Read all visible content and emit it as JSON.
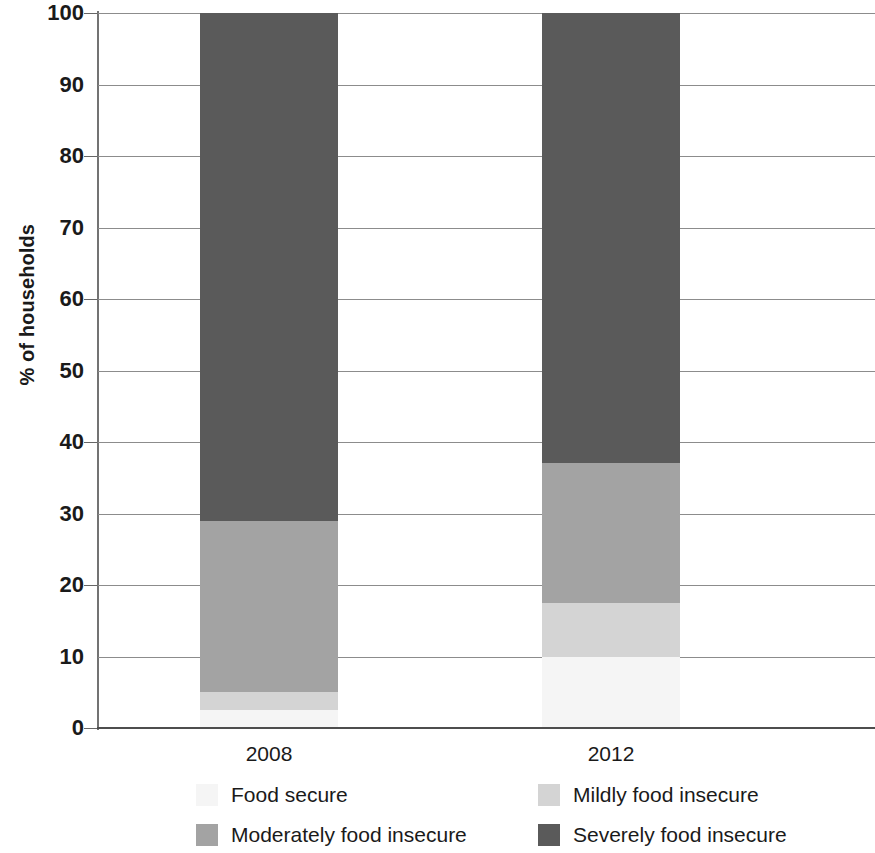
{
  "chart_data": {
    "type": "bar",
    "subtype": "stacked-bar-100",
    "title": "",
    "xlabel": "",
    "ylabel": "% of households",
    "categories": [
      "2008",
      "2012"
    ],
    "ylim": [
      0,
      100
    ],
    "yticks": [
      0,
      10,
      20,
      30,
      40,
      50,
      60,
      70,
      80,
      90,
      100
    ],
    "ytick_labels": [
      "0",
      "10",
      "20",
      "30",
      "40",
      "50",
      "60",
      "70",
      "80",
      "90",
      "100"
    ],
    "grid": true,
    "legend_position": "bottom",
    "stack_order_bottom_to_top": [
      "Food secure",
      "Mildly food insecure",
      "Moderately food insecure",
      "Severely food insecure"
    ],
    "series": [
      {
        "name": "Food secure",
        "color": "#f5f5f5",
        "values": [
          2.5,
          10.0
        ]
      },
      {
        "name": "Mildly food insecure",
        "color": "#d4d4d4",
        "values": [
          2.5,
          7.5
        ]
      },
      {
        "name": "Moderately food insecure",
        "color": "#a3a3a3",
        "values": [
          24.0,
          19.5
        ]
      },
      {
        "name": "Severely food insecure",
        "color": "#5a5a5a",
        "values": [
          71.0,
          63.0
        ]
      }
    ],
    "cumulative_tops": {
      "2008": {
        "Food secure": 2.5,
        "Mildly food insecure": 5.0,
        "Moderately food insecure": 29.0,
        "Severely food insecure": 100.0
      },
      "2012": {
        "Food secure": 10.0,
        "Mildly food insecure": 17.5,
        "Moderately food insecure": 37.0,
        "Severely food insecure": 100.0
      }
    },
    "legend": [
      {
        "label": "Food secure",
        "color": "#f5f5f5"
      },
      {
        "label": "Mildly food insecure",
        "color": "#d4d4d4"
      },
      {
        "label": "Moderately food insecure",
        "color": "#a3a3a3"
      },
      {
        "label": "Severely food insecure",
        "color": "#5a5a5a"
      }
    ]
  },
  "axis": {
    "y_title": "% of households"
  },
  "colors": {
    "food_secure": "#f5f5f5",
    "mildly_food_insecure": "#d4d4d4",
    "moderately_food_insecure": "#a3a3a3",
    "severely_food_insecure": "#5a5a5a",
    "gridline": "#8c8c8c",
    "axis": "#4d4d4d",
    "text": "#1a1a1a",
    "background": "#ffffff"
  }
}
